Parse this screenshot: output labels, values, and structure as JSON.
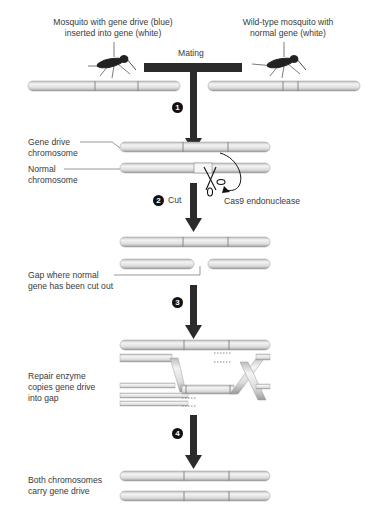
{
  "title_labels": {
    "left_mosquito": [
      "Mosquito with gene drive (blue)",
      "inserted into gene (white)"
    ],
    "right_mosquito": [
      "Wild-type mosquito with",
      "normal gene (white)"
    ],
    "mating": "Mating"
  },
  "steps": [
    {
      "number": "1",
      "label": ""
    },
    {
      "number": "2",
      "label": "Cut"
    },
    {
      "number": "3",
      "label": ""
    },
    {
      "number": "4",
      "label": ""
    }
  ],
  "labels": {
    "gene_drive_chromosome": [
      "Gene drive",
      "chromosome"
    ],
    "normal_chromosome": [
      "Normal",
      "chromosome"
    ],
    "cas9": "Cas9 endonuclease",
    "gap": [
      "Gap where normal",
      "gene has been cut out"
    ],
    "repair": [
      "Repair enzyme",
      "copies gene drive",
      "into gap"
    ],
    "both": [
      "Both chromosomes",
      "carry gene drive"
    ]
  },
  "colors": {
    "chromosome_fill": "#e6e6e6",
    "chromosome_edge": "#9a9a9a",
    "arrow": "#3a3a3a",
    "text": "#3a3a3a"
  }
}
